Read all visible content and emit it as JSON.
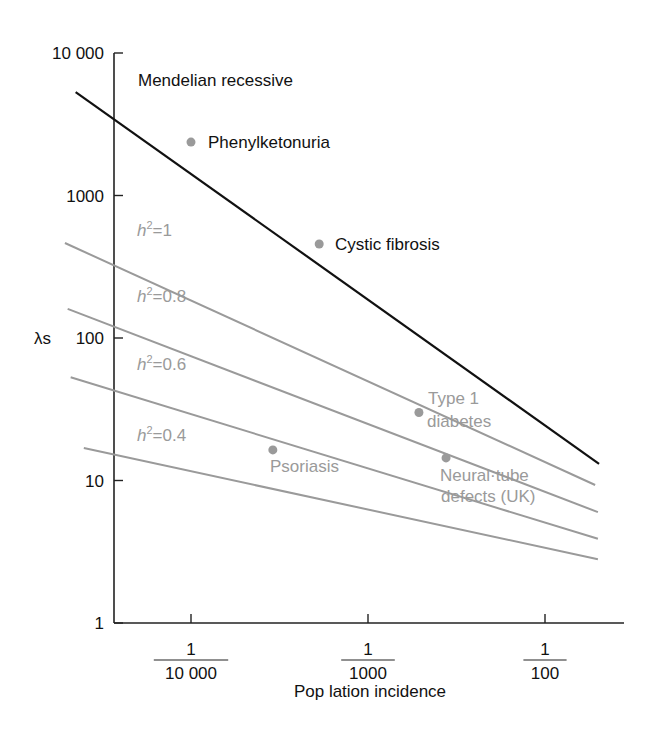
{
  "chart_data": {
    "type": "line",
    "title": "",
    "xlabel": "Pop lation incidence",
    "ylabel": "λs",
    "xscale": "log",
    "yscale": "log",
    "xlim": [
      2.24e-05,
      0.0204
    ],
    "ylim": [
      1,
      10000
    ],
    "grid": false,
    "legend": "inline labels",
    "y_ticks": [
      {
        "value": 1,
        "label": "1"
      },
      {
        "value": 10,
        "label": "10"
      },
      {
        "value": 100,
        "label": "100"
      },
      {
        "value": 1000,
        "label": "1000"
      },
      {
        "value": 10000,
        "label": "10 000"
      }
    ],
    "x_ticks": [
      {
        "value": 0.0001,
        "numerator": "1",
        "denominator": "10 000"
      },
      {
        "value": 0.001,
        "numerator": "1",
        "denominator": "1000"
      },
      {
        "value": 0.01,
        "numerator": "1",
        "denominator": "100"
      }
    ],
    "series": [
      {
        "name": "Mendelian recessive",
        "label": "Mendelian recessive",
        "color": "#111111",
        "x": [
          2.23e-05,
          0.0202
        ],
        "y": [
          5320,
          13.1
        ]
      },
      {
        "name": "h2=1",
        "label_value": "1",
        "color": "#9a9a9a",
        "x": [
          1.94e-05,
          0.0192
        ],
        "y": [
          464,
          9.3
        ]
      },
      {
        "name": "h2=0.8",
        "label_value": "0.8",
        "color": "#9a9a9a",
        "x": [
          2.01e-05,
          0.0199
        ],
        "y": [
          160,
          6.0
        ]
      },
      {
        "name": "h2=0.6",
        "label_value": "0.6",
        "color": "#9a9a9a",
        "x": [
          2.09e-05,
          0.0199
        ],
        "y": [
          53,
          3.9
        ]
      },
      {
        "name": "h2=0.4",
        "label_value": "0.4",
        "color": "#9a9a9a",
        "x": [
          2.48e-05,
          0.0199
        ],
        "y": [
          16.9,
          2.8
        ]
      }
    ],
    "points": [
      {
        "label": "Phenylketonuria",
        "x": 0.0001,
        "y": 2370,
        "label_color": "#111111"
      },
      {
        "label": "Cystic fibrosis",
        "x": 0.00053,
        "y": 457,
        "label_color": "#111111"
      },
      {
        "label": "Type 1 diabetes",
        "label_lines": [
          "Type 1",
          "diabetes"
        ],
        "x": 0.00194,
        "y": 30,
        "label_color": "#9a9a9a"
      },
      {
        "label": "Neural tube defects (UK)",
        "label_lines": [
          "Neural·tube",
          "defects (UK)"
        ],
        "x": 0.00276,
        "y": 14.4,
        "label_color": "#9a9a9a"
      },
      {
        "label": "Psoriasis",
        "x": 0.00029,
        "y": 16.4,
        "label_color": "#9a9a9a"
      }
    ]
  },
  "labels": {
    "ylabel": "λs",
    "xlabel": "Pop lation incidence",
    "mendelian": "Mendelian recessive",
    "pku": "Phenylketonuria",
    "cf": "Cystic fibrosis",
    "type1_line1": "Type 1",
    "type1_line2": "diabetes",
    "ntd_line1": "Neural·tube",
    "ntd_line2": "defects (UK)",
    "psoriasis": "Psoriasis",
    "h_prefix": "h",
    "h_sup": "2",
    "h_eq": "="
  },
  "colors": {
    "axis": "#222222",
    "mendelian": "#111111",
    "heritability": "#9a9a9a",
    "point": "#9a9a9a"
  }
}
